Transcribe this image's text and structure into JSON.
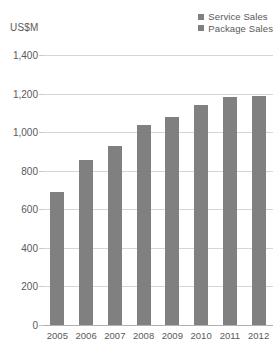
{
  "chart_data": {
    "type": "bar",
    "barmode": "stacked",
    "title": "",
    "xlabel": "",
    "ylabel": "US$M",
    "categories": [
      "2005",
      "2006",
      "2007",
      "2008",
      "2009",
      "2010",
      "2011",
      "2012"
    ],
    "series": [
      {
        "name": "Service Sales",
        "color": "#808080",
        "values": [
          0,
          0,
          0,
          0,
          0,
          0,
          0,
          0
        ]
      },
      {
        "name": "Package Sales",
        "color": "#808080",
        "values": [
          690,
          855,
          928,
          1037,
          1080,
          1140,
          1180,
          1190
        ]
      }
    ],
    "ylim": [
      0,
      1400
    ],
    "ytick_values": [
      0,
      200,
      400,
      600,
      800,
      1000,
      1200,
      1400
    ],
    "ytick_labels": [
      "0",
      "200",
      "400",
      "600",
      "800",
      "1,000",
      "1,200",
      "1,400"
    ],
    "grid": true,
    "legend_position": "top-right",
    "gridline_color": "#d6d6d6",
    "text_color": "#595959"
  }
}
